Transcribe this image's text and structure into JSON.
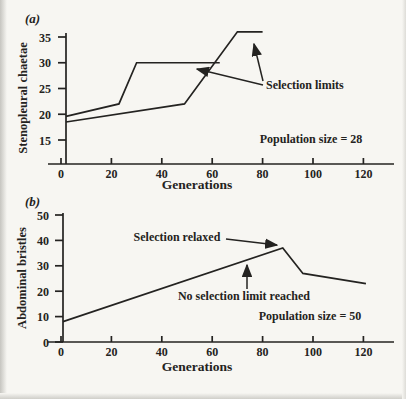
{
  "figure": {
    "panel_count": 2
  },
  "chart_data": [
    {
      "type": "line",
      "panel_label": "(a)",
      "xlabel": "Generations",
      "ylabel": "Stenopleural chaetae",
      "xticks": [
        0,
        20,
        40,
        60,
        80,
        100,
        120
      ],
      "yticks": [
        15,
        20,
        25,
        30,
        35
      ],
      "xlim": [
        0,
        132
      ],
      "ylim": [
        12,
        37
      ],
      "grid": false,
      "legend": "none",
      "series": [
        {
          "name": "selection-line-1",
          "points": [
            [
              0,
              19.6
            ],
            [
              23,
              22
            ],
            [
              30,
              30
            ],
            [
              63,
              30
            ]
          ]
        },
        {
          "name": "selection-line-2",
          "points": [
            [
              0,
              18.5
            ],
            [
              49,
              22
            ],
            [
              70,
              36
            ],
            [
              80,
              36
            ]
          ]
        }
      ],
      "annotations": [
        {
          "text": "Selection limits",
          "target": "two arrows pointing to the plateaus at 36 and 30"
        },
        {
          "text": "Population size = 28"
        }
      ]
    },
    {
      "type": "line",
      "panel_label": "(b)",
      "xlabel": "Generations",
      "ylabel": "Abdominal bristles",
      "xticks": [
        0,
        20,
        40,
        60,
        80,
        100,
        120
      ],
      "yticks": [
        0,
        10,
        20,
        30,
        40,
        50
      ],
      "xlim": [
        0,
        132
      ],
      "ylim": [
        0,
        50
      ],
      "grid": false,
      "legend": "none",
      "series": [
        {
          "name": "selected-line",
          "points": [
            [
              0,
              8
            ],
            [
              88,
              37
            ],
            [
              96,
              27
            ],
            [
              121,
              23
            ]
          ]
        }
      ],
      "annotations": [
        {
          "text": "Selection relaxed",
          "target": "arrow pointing to peak at generation ~90"
        },
        {
          "text": "No selection limit reached",
          "target": "vertical arrow pointing up at rising line near generation ~74"
        },
        {
          "text": "Population size = 50"
        }
      ]
    }
  ],
  "colors": {
    "ink": "#242321",
    "paper": "#f7f6f2",
    "scan_edge": "#c6c5c0"
  }
}
